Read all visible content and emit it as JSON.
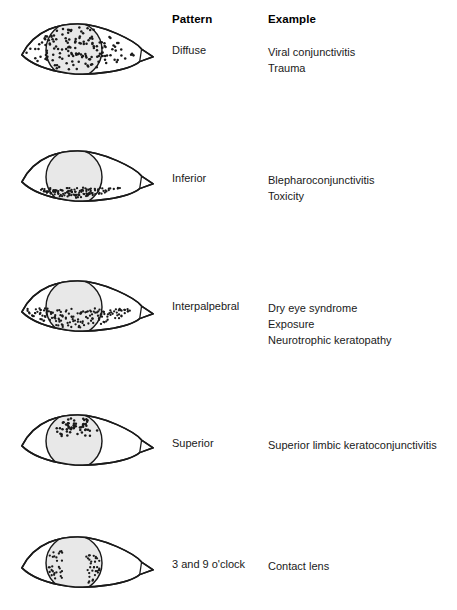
{
  "figure": {
    "headers": {
      "pattern": "Pattern",
      "example": "Example"
    },
    "colors": {
      "outline": "#1a1a1a",
      "cornea_fill": "#e8e8e8",
      "dot": "#1a1a1a",
      "background": "#ffffff",
      "text": "#1a1a1a"
    },
    "rows": [
      {
        "id": "diffuse",
        "pattern": "Diffuse",
        "examples": [
          "Viral conjunctivitis",
          "Trauma"
        ],
        "eye_top": 15,
        "label_top": 44,
        "examples_top": 44,
        "staining": {
          "region": "diffuse",
          "description": "Fine dots scattered evenly over the entire cornea and exposed conjunctiva",
          "dot_count": 150,
          "dot_radius": 1.3,
          "seed": 11
        }
      },
      {
        "id": "inferior",
        "pattern": "Inferior",
        "examples": [
          "Blepharoconjunctivitis",
          "Toxicity"
        ],
        "eye_top": 142,
        "label_top": 172,
        "examples_top": 172,
        "staining": {
          "region": "inferior",
          "description": "Dots concentrated along the inferior cornea and lower conjunctiva",
          "dot_count": 120,
          "dot_radius": 1.2,
          "seed": 23
        }
      },
      {
        "id": "interpalpebral",
        "pattern": "Interpalpebral",
        "examples": [
          "Dry eye syndrome",
          "Exposure",
          "Neurotrophic keratopathy"
        ],
        "eye_top": 272,
        "label_top": 300,
        "examples_top": 300,
        "staining": {
          "region": "interpalpebral",
          "description": "A horizontal band of dots across the mid cornea between the lids",
          "dot_count": 150,
          "dot_radius": 1.2,
          "seed": 37
        }
      },
      {
        "id": "superior",
        "pattern": "Superior",
        "examples": [
          "Superior limbic keratoconjunctivitis"
        ],
        "eye_top": 406,
        "label_top": 437,
        "examples_top": 437,
        "staining": {
          "region": "superior",
          "description": "Dots clustered over the superior cornea near the upper limbus",
          "dot_count": 55,
          "dot_radius": 1.3,
          "seed": 59
        }
      },
      {
        "id": "three-and-nine-oclock",
        "pattern": "3 and 9 o'clock",
        "examples": [
          "Contact lens"
        ],
        "eye_top": 528,
        "label_top": 558,
        "examples_top": 558,
        "staining": {
          "region": "three-nine",
          "description": "Two dot clusters at the nasal and temporal cornea, at the 3 and 9 o'clock positions",
          "dot_count": 60,
          "dot_radius": 1.2,
          "seed": 71
        }
      }
    ],
    "eye_geometry": {
      "medial_canthus_x": 4,
      "lateral_canthus_x": 128,
      "lid_midline_y": 40,
      "upper_lid_peak_y": 8,
      "lower_lid_trough_y": 59,
      "cornea_center_x": 58,
      "cornea_center_y": 35,
      "cornea_radius": 29
    }
  }
}
